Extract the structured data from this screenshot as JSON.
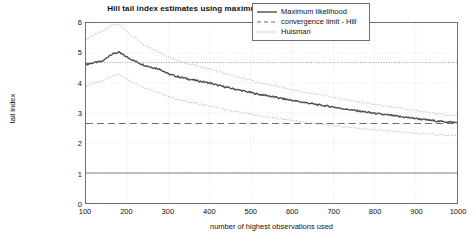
{
  "chart_data": {
    "type": "line",
    "title": "Hill tail index estimates using maximum likelihood versus Huisman",
    "xlabel": "number of highest observations used",
    "ylabel": "tail index",
    "xlim": [
      100,
      1000
    ],
    "ylim": [
      0,
      6
    ],
    "xticks": [
      100,
      200,
      300,
      400,
      500,
      600,
      700,
      800,
      900,
      1000
    ],
    "yticks": [
      0,
      1,
      2,
      3,
      4,
      5,
      6
    ],
    "grid": true,
    "legend_position": "top-right",
    "legend": [
      {
        "label": "Maximum likelihood",
        "style": "solid",
        "color": "#4d4d4d"
      },
      {
        "label": "convergence limit - Hill",
        "style": "dashed",
        "color": "#6b6b6b"
      },
      {
        "label": "Huisman",
        "style": "dotted",
        "color": "#9a9a9a"
      }
    ],
    "reference_lines": [
      {
        "name": "convergence limit - Hill",
        "value": 2.65,
        "style": "dashed",
        "color": "#6b6b6b"
      },
      {
        "name": "upper dotted reference",
        "value": 4.68,
        "style": "dotted",
        "color": "#9a9a9a"
      },
      {
        "name": "unit reference",
        "value": 1.0,
        "style": "solid",
        "color": "#a8a8a8"
      }
    ],
    "x": [
      100,
      120,
      140,
      160,
      180,
      200,
      220,
      240,
      260,
      280,
      300,
      320,
      340,
      360,
      380,
      400,
      420,
      440,
      460,
      480,
      500,
      520,
      540,
      560,
      580,
      600,
      620,
      640,
      660,
      680,
      700,
      720,
      740,
      760,
      780,
      800,
      820,
      840,
      860,
      880,
      900,
      920,
      940,
      960,
      980,
      1000
    ],
    "series": [
      {
        "name": "Maximum likelihood",
        "style": "solid",
        "color": "#4d4d4d",
        "values": [
          4.62,
          4.68,
          4.72,
          4.95,
          5.02,
          4.86,
          4.72,
          4.6,
          4.52,
          4.46,
          4.3,
          4.22,
          4.16,
          4.1,
          4.05,
          4.0,
          3.92,
          3.86,
          3.8,
          3.74,
          3.68,
          3.62,
          3.58,
          3.52,
          3.47,
          3.42,
          3.37,
          3.33,
          3.28,
          3.24,
          3.2,
          3.15,
          3.11,
          3.07,
          3.03,
          2.99,
          2.95,
          2.92,
          2.88,
          2.85,
          2.82,
          2.78,
          2.75,
          2.72,
          2.7,
          2.68
        ]
      },
      {
        "name": "Huisman upper",
        "style": "dotted",
        "color": "#9a9a9a",
        "values": [
          5.45,
          5.6,
          5.72,
          5.92,
          5.95,
          5.7,
          5.48,
          5.3,
          5.15,
          5.02,
          4.86,
          4.76,
          4.68,
          4.6,
          4.53,
          4.47,
          4.38,
          4.3,
          4.23,
          4.16,
          4.09,
          4.02,
          3.96,
          3.9,
          3.84,
          3.78,
          3.72,
          3.67,
          3.62,
          3.57,
          3.52,
          3.47,
          3.42,
          3.37,
          3.33,
          3.28,
          3.24,
          3.2,
          3.16,
          3.12,
          3.08,
          3.04,
          3.0,
          2.96,
          2.93,
          2.9
        ]
      },
      {
        "name": "Huisman lower",
        "style": "dotted",
        "color": "#9a9a9a",
        "values": [
          3.9,
          4.0,
          4.06,
          4.22,
          4.28,
          4.12,
          3.98,
          3.86,
          3.76,
          3.68,
          3.54,
          3.46,
          3.4,
          3.34,
          3.29,
          3.24,
          3.17,
          3.11,
          3.06,
          3.01,
          2.96,
          2.91,
          2.87,
          2.83,
          2.79,
          2.75,
          2.71,
          2.68,
          2.64,
          2.61,
          2.58,
          2.55,
          2.52,
          2.49,
          2.46,
          2.44,
          2.41,
          2.39,
          2.37,
          2.35,
          2.33,
          2.31,
          2.29,
          2.27,
          2.26,
          2.25
        ]
      }
    ]
  }
}
